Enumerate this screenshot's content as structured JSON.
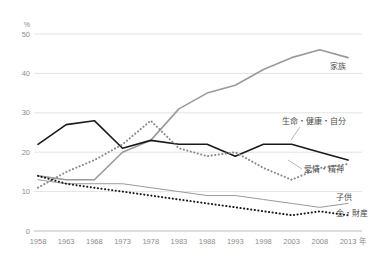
{
  "chart_data": {
    "type": "line",
    "title": "",
    "xlabel": "年",
    "ylabel": "%",
    "ylim": [
      0,
      50
    ],
    "yticks": [
      0,
      10,
      20,
      30,
      40,
      50
    ],
    "grid": true,
    "legend_position": "right-inline-labels",
    "categories": [
      "1958",
      "1963",
      "1968",
      "1973",
      "1978",
      "1983",
      "1988",
      "1993",
      "1998",
      "2003",
      "2008",
      "2013"
    ],
    "x": [
      1958,
      1963,
      1968,
      1973,
      1978,
      1983,
      1988,
      1993,
      1998,
      2003,
      2008,
      2013
    ],
    "series": [
      {
        "name": "家族",
        "style": "solid",
        "color": "#9a9a9a",
        "width": 1.6,
        "values": [
          14,
          13,
          13,
          20,
          23,
          31,
          35,
          37,
          41,
          44,
          46,
          44
        ]
      },
      {
        "name": "生命・健康・自分",
        "style": "solid",
        "color": "#1a1a1a",
        "width": 1.6,
        "values": [
          22,
          27,
          28,
          21,
          23,
          22,
          22,
          19,
          22,
          22,
          20,
          18
        ]
      },
      {
        "name": "愛情・精神",
        "style": "dotted",
        "color": "#8a8a8a",
        "width": 2.0,
        "values": [
          11,
          15,
          18,
          22,
          28,
          21,
          19,
          20,
          16,
          13,
          16,
          17
        ]
      },
      {
        "name": "子供",
        "style": "solid",
        "color": "#9a9a9a",
        "width": 1.0,
        "values": [
          13,
          12,
          12,
          12,
          11,
          10,
          9,
          9,
          8,
          7,
          6,
          7
        ]
      },
      {
        "name": "金・財産",
        "style": "dotted",
        "color": "#1a1a1a",
        "width": 2.0,
        "values": [
          14,
          12,
          11,
          10,
          9,
          8,
          7,
          6,
          5,
          4,
          5,
          4
        ]
      }
    ],
    "annotations": [
      {
        "label": "家族",
        "x": 2013,
        "y": 42
      },
      {
        "label": "生命・健康・自分",
        "x": 2008,
        "y": 25
      },
      {
        "label": "愛情・精神",
        "x": 2005,
        "y": 14
      },
      {
        "label": "子供",
        "x": 2013,
        "y": 8
      },
      {
        "label": "金・財産",
        "x": 2013,
        "y": 4
      }
    ]
  },
  "axis": {
    "unit": "%",
    "x_unit": "年",
    "ytick_labels": [
      "0",
      "10",
      "20",
      "30",
      "40",
      "50"
    ],
    "xtick_labels": [
      "1958",
      "1963",
      "1968",
      "1973",
      "1978",
      "1983",
      "1988",
      "1993",
      "1998",
      "2003",
      "2008",
      "2013"
    ]
  },
  "legend": {
    "family": "家族",
    "life_health_self": "生命・健康・自分",
    "love_spirit": "愛情・精神",
    "children": "子供",
    "money_property": "金・財産"
  }
}
